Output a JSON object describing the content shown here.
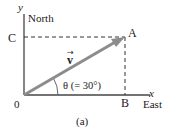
{
  "diagram": {
    "axes": {
      "y_label": "y",
      "y_direction": "North",
      "x_label": "x",
      "x_direction": "East",
      "origin_label": "0"
    },
    "points": {
      "A": "A",
      "B": "B",
      "C": "C"
    },
    "vector": {
      "label": "v",
      "angle_label": "θ (= 30°)",
      "angle_deg": 30,
      "color": "#8c8c8c"
    },
    "caption": "(a)"
  }
}
